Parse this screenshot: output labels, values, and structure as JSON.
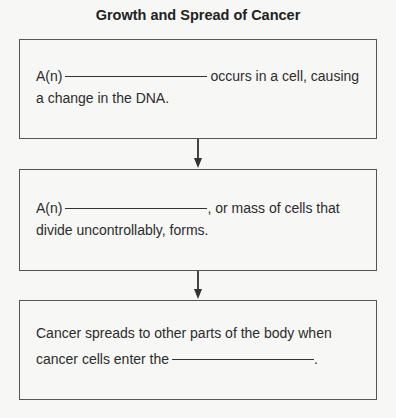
{
  "title": "Growth and Spread of Cancer",
  "boxes": [
    {
      "line1_prefix": "A(n)",
      "line1_suffix": "occurs in a cell, causing",
      "line2": "a change in the DNA."
    },
    {
      "line1_prefix": "A(n)",
      "line1_suffix": ", or mass of cells that",
      "line2": "divide uncontrollably, forms."
    },
    {
      "line1": "Cancer spreads to other parts of the body when",
      "line2_prefix": "cancer cells enter the",
      "line2_suffix": "."
    }
  ]
}
